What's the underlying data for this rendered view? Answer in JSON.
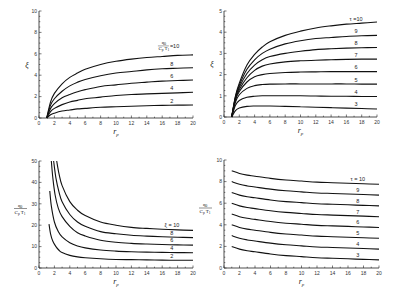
{
  "chart_data": [
    {
      "id": "top-left",
      "type": "line",
      "title": "",
      "xlabel": "r_p",
      "ylabel": "ξ",
      "xlim": [
        0,
        20
      ],
      "ylim": [
        0,
        10
      ],
      "xticks": [
        0,
        2,
        4,
        6,
        8,
        10,
        12,
        14,
        16,
        18,
        20
      ],
      "yticks": [
        0,
        2,
        4,
        6,
        8,
        10
      ],
      "grid": false,
      "legend_param": "q_0/(C_p T_1)",
      "frame": {
        "x0": 39,
        "x1": 193,
        "y0": 118,
        "y1": 11
      },
      "x": [
        1,
        1.5,
        2,
        3,
        4,
        5,
        6,
        8,
        10,
        12,
        14,
        16,
        18,
        20
      ],
      "series": [
        {
          "name": "10",
          "label": "q0/(Cp T1) = 10",
          "values": [
            0,
            1.5,
            2.3,
            3.2,
            3.8,
            4.2,
            4.55,
            5.0,
            5.3,
            5.5,
            5.65,
            5.75,
            5.85,
            5.9
          ]
        },
        {
          "name": "8",
          "label": "8",
          "values": [
            0,
            1.2,
            1.8,
            2.5,
            3.0,
            3.35,
            3.6,
            3.95,
            4.2,
            4.35,
            4.5,
            4.6,
            4.65,
            4.7
          ]
        },
        {
          "name": "6",
          "label": "6",
          "values": [
            0,
            0.9,
            1.35,
            1.9,
            2.2,
            2.45,
            2.65,
            2.95,
            3.1,
            3.25,
            3.35,
            3.45,
            3.5,
            3.55
          ]
        },
        {
          "name": "4",
          "label": "4",
          "values": [
            0,
            0.6,
            0.9,
            1.25,
            1.5,
            1.65,
            1.8,
            1.95,
            2.1,
            2.2,
            2.25,
            2.3,
            2.35,
            2.4
          ]
        },
        {
          "name": "2",
          "label": "2",
          "values": [
            0,
            0.3,
            0.45,
            0.65,
            0.75,
            0.85,
            0.9,
            1.0,
            1.05,
            1.1,
            1.15,
            1.18,
            1.2,
            1.22
          ]
        }
      ]
    },
    {
      "id": "top-right",
      "type": "line",
      "title": "",
      "xlabel": "r_p",
      "ylabel": "ξ",
      "xlim": [
        0,
        20
      ],
      "ylim": [
        0,
        5
      ],
      "xticks": [
        0,
        2,
        4,
        6,
        8,
        10,
        12,
        14,
        16,
        18,
        20
      ],
      "yticks": [
        0,
        1,
        2,
        3,
        4,
        5
      ],
      "grid": false,
      "legend_param": "τ",
      "frame": {
        "x0": 224,
        "x1": 377,
        "y0": 117,
        "y1": 11
      },
      "x": [
        1,
        1.5,
        2,
        3,
        4,
        5,
        6,
        8,
        10,
        12,
        14,
        16,
        18,
        20
      ],
      "series": [
        {
          "name": "10",
          "label": "τ =10",
          "values": [
            0,
            1.0,
            1.6,
            2.45,
            2.95,
            3.3,
            3.55,
            3.85,
            4.05,
            4.2,
            4.3,
            4.38,
            4.43,
            4.48
          ]
        },
        {
          "name": "9",
          "label": "9",
          "values": [
            0,
            0.95,
            1.5,
            2.25,
            2.7,
            3.0,
            3.2,
            3.45,
            3.6,
            3.7,
            3.75,
            3.8,
            3.83,
            3.85
          ]
        },
        {
          "name": "8",
          "label": "8",
          "values": [
            0,
            0.9,
            1.4,
            2.05,
            2.45,
            2.7,
            2.85,
            3.0,
            3.1,
            3.18,
            3.22,
            3.25,
            3.27,
            3.28
          ]
        },
        {
          "name": "7",
          "label": "7",
          "values": [
            0,
            0.85,
            1.3,
            1.85,
            2.2,
            2.4,
            2.5,
            2.6,
            2.65,
            2.68,
            2.7,
            2.72,
            2.73,
            2.73
          ]
        },
        {
          "name": "6",
          "label": "6",
          "values": [
            0,
            0.8,
            1.2,
            1.65,
            1.9,
            2.0,
            2.05,
            2.1,
            2.12,
            2.13,
            2.14,
            2.14,
            2.14,
            2.14
          ]
        },
        {
          "name": "5",
          "label": "5",
          "values": [
            0,
            0.7,
            1.05,
            1.35,
            1.48,
            1.53,
            1.55,
            1.56,
            1.56,
            1.56,
            1.56,
            1.56,
            1.55,
            1.55
          ]
        },
        {
          "name": "4",
          "label": "4",
          "values": [
            0,
            0.55,
            0.78,
            0.93,
            0.98,
            1.0,
            1.0,
            1.0,
            1.0,
            0.99,
            0.98,
            0.98,
            0.97,
            0.97
          ]
        },
        {
          "name": "3",
          "label": "3",
          "values": [
            0,
            0.3,
            0.42,
            0.5,
            0.52,
            0.52,
            0.52,
            0.5,
            0.48,
            0.46,
            0.44,
            0.42,
            0.4,
            0.38
          ]
        }
      ]
    },
    {
      "id": "bottom-left",
      "type": "line",
      "title": "",
      "xlabel": "r_p",
      "ylabel": "q_0/(C_p T_1)",
      "xlim": [
        0,
        20
      ],
      "ylim": [
        0,
        50
      ],
      "xticks": [
        0,
        2,
        4,
        6,
        8,
        10,
        12,
        14,
        16,
        18,
        20
      ],
      "yticks": [
        0,
        10,
        20,
        30,
        40,
        50
      ],
      "grid": false,
      "legend_param": "ξ",
      "frame": {
        "x0": 39,
        "x1": 193,
        "y0": 268,
        "y1": 161
      },
      "series": [
        {
          "name": "10",
          "label": "ξ = 10",
          "x": [
            2.3,
            2.6,
            3,
            4,
            5,
            6,
            8,
            10,
            12,
            14,
            16,
            18,
            20
          ],
          "values": [
            50,
            44,
            38.5,
            31,
            27,
            24.5,
            21.5,
            20,
            19,
            18.5,
            18.1,
            17.8,
            17.6
          ]
        },
        {
          "name": "8",
          "label": "8",
          "x": [
            1.9,
            2.2,
            2.6,
            3,
            4,
            5,
            6,
            8,
            10,
            12,
            14,
            16,
            18,
            20
          ],
          "values": [
            50,
            42,
            35.5,
            31,
            25,
            21.5,
            19.5,
            17,
            16,
            15.3,
            14.9,
            14.6,
            14.4,
            14.2
          ]
        },
        {
          "name": "6",
          "label": "6",
          "x": [
            1.6,
            1.8,
            2.1,
            2.5,
            3,
            4,
            5,
            6,
            8,
            10,
            12,
            14,
            16,
            18,
            20
          ],
          "values": [
            50,
            42,
            34,
            28,
            24,
            19.5,
            16.5,
            15,
            13,
            12,
            11.5,
            11.2,
            11,
            10.8,
            10.7
          ]
        },
        {
          "name": "4",
          "label": "4",
          "x": [
            1.4,
            1.6,
            2,
            2.5,
            3,
            4,
            5,
            6,
            8,
            10,
            12,
            14,
            16,
            18,
            20
          ],
          "values": [
            36,
            29,
            21.5,
            17,
            14.5,
            11.8,
            10.3,
            9.4,
            8.4,
            7.9,
            7.6,
            7.4,
            7.3,
            7.2,
            7.1
          ]
        },
        {
          "name": "2",
          "label": "2",
          "x": [
            1.3,
            1.5,
            1.8,
            2.2,
            2.6,
            3,
            4,
            5,
            6,
            8,
            10,
            12,
            14,
            16,
            18,
            20
          ],
          "values": [
            20.5,
            16,
            12.5,
            10,
            8.3,
            7.2,
            5.9,
            5.2,
            4.8,
            4.3,
            4.0,
            3.9,
            3.8,
            3.7,
            3.6,
            3.6
          ]
        }
      ]
    },
    {
      "id": "bottom-right",
      "type": "line",
      "title": "",
      "xlabel": "r_p",
      "ylabel": "q_0/(C_p T_1)",
      "xlim": [
        0,
        20
      ],
      "ylim": [
        0,
        10
      ],
      "xticks": [
        0,
        2,
        4,
        6,
        8,
        10,
        12,
        14,
        16,
        18,
        20
      ],
      "yticks": [
        0,
        2,
        4,
        6,
        8,
        10
      ],
      "grid": false,
      "legend_param": "τ",
      "frame": {
        "x0": 224,
        "x1": 379,
        "y0": 268,
        "y1": 160
      },
      "x": [
        1,
        2,
        3,
        4,
        6,
        8,
        10,
        12,
        14,
        16,
        18,
        20
      ],
      "series": [
        {
          "name": "10",
          "label": "τ = 10",
          "values": [
            9,
            8.75,
            8.6,
            8.5,
            8.3,
            8.15,
            8.05,
            7.95,
            7.9,
            7.85,
            7.8,
            7.75
          ]
        },
        {
          "name": "9",
          "label": "9",
          "values": [
            8,
            7.75,
            7.6,
            7.5,
            7.3,
            7.15,
            7.05,
            6.95,
            6.9,
            6.85,
            6.8,
            6.75
          ]
        },
        {
          "name": "8",
          "label": "8",
          "values": [
            7,
            6.75,
            6.6,
            6.5,
            6.3,
            6.15,
            6.05,
            5.95,
            5.9,
            5.85,
            5.8,
            5.75
          ]
        },
        {
          "name": "7",
          "label": "7",
          "values": [
            6,
            5.75,
            5.6,
            5.5,
            5.3,
            5.15,
            5.05,
            4.95,
            4.9,
            4.85,
            4.8,
            4.75
          ]
        },
        {
          "name": "6",
          "label": "6",
          "values": [
            5,
            4.75,
            4.6,
            4.5,
            4.3,
            4.15,
            4.05,
            3.95,
            3.9,
            3.85,
            3.8,
            3.75
          ]
        },
        {
          "name": "5",
          "label": "5",
          "values": [
            4,
            3.75,
            3.6,
            3.5,
            3.3,
            3.15,
            3.05,
            2.95,
            2.9,
            2.85,
            2.8,
            2.75
          ]
        },
        {
          "name": "4",
          "label": "4",
          "values": [
            3,
            2.75,
            2.6,
            2.5,
            2.3,
            2.15,
            2.05,
            1.95,
            1.9,
            1.85,
            1.8,
            1.75
          ]
        },
        {
          "name": "3",
          "label": "3",
          "values": [
            2,
            1.75,
            1.6,
            1.5,
            1.3,
            1.15,
            1.05,
            0.95,
            0.9,
            0.85,
            0.8,
            0.75
          ]
        }
      ]
    }
  ],
  "labels": {
    "xlabel": "r",
    "xlabel_sub": "p",
    "xi": "ξ",
    "tau": "τ",
    "frac_num": "q",
    "frac_num_sub": "0",
    "frac_den": "C",
    "frac_den_sub": "p",
    "frac_den2": "T",
    "frac_den2_sub": "1"
  }
}
